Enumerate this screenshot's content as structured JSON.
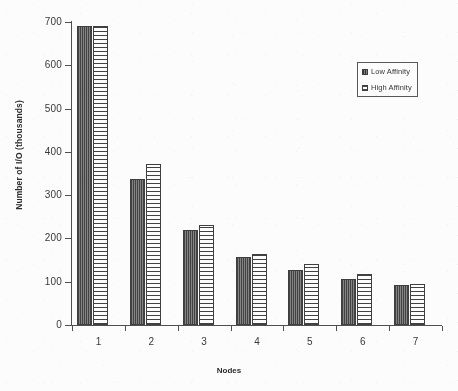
{
  "chart_data": {
    "type": "bar",
    "title": "",
    "xlabel": "Nodes",
    "ylabel": "Number of I/O (thousands)",
    "categories": [
      "1",
      "2",
      "3",
      "4",
      "5",
      "6",
      "7"
    ],
    "series": [
      {
        "name": "Low Affinity",
        "values": [
          690,
          338,
          220,
          158,
          127,
          107,
          92
        ]
      },
      {
        "name": "High Affinity",
        "values": [
          690,
          372,
          232,
          165,
          140,
          117,
          94
        ]
      }
    ],
    "ylim": [
      0,
      700
    ],
    "ytick_labels": [
      "700",
      "600",
      "500",
      "400",
      "300",
      "200",
      "100",
      "0"
    ],
    "ytick_values": [
      700,
      600,
      500,
      400,
      300,
      200,
      100,
      0
    ],
    "grid": false,
    "legend_position": "upper-right"
  },
  "legend": {
    "entries": [
      {
        "label": "Low Affinity",
        "swatch": "low-affinity-swatch"
      },
      {
        "label": "High Affinity",
        "swatch": "high-affinity-swatch"
      }
    ]
  }
}
